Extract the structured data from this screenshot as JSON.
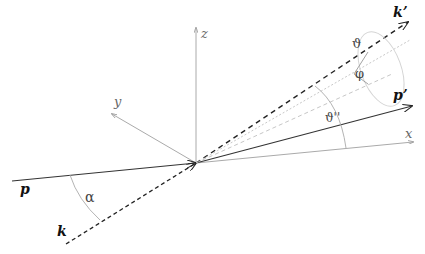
{
  "diagram": {
    "type": "scattering-kinematics",
    "axes": {
      "x_label": "x",
      "y_label": "y",
      "z_label": "z"
    },
    "vectors": {
      "p_label": "p",
      "k_label": "k",
      "p_prime_label": "p’",
      "k_prime_label": "k’"
    },
    "angles": {
      "alpha": "α",
      "theta": "ϑ",
      "theta_double_prime": "ϑ''",
      "phi": "φ"
    },
    "colors": {
      "vector_line": "#333333",
      "axis_line": "#aaaaaa",
      "guide_line": "#bbbbbb",
      "dotted_guide": "#c0c0c0"
    }
  }
}
